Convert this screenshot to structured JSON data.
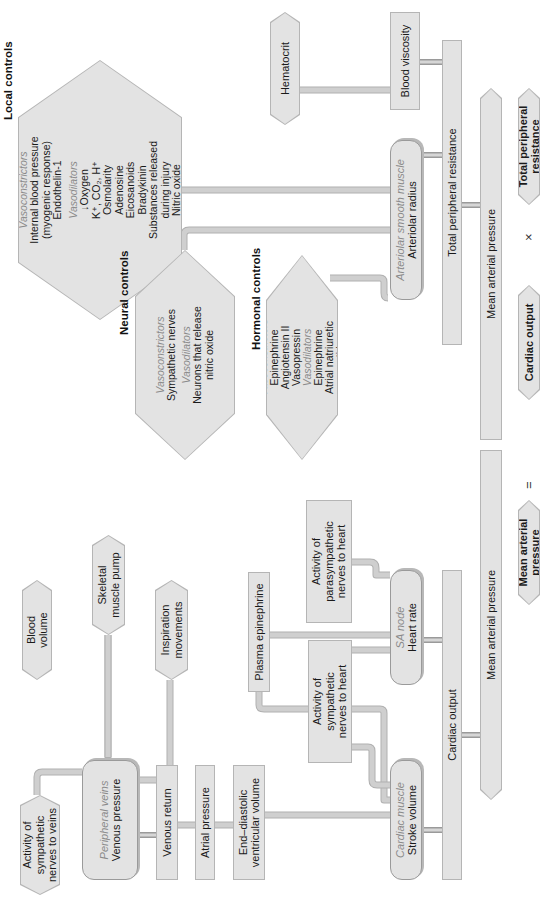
{
  "diagram": {
    "orientation": "rotated 90 degrees counter-clockwise",
    "cardiac_side": {
      "sympathetic_veins": {
        "line1": "Activity of",
        "line2": "sympathetic",
        "line3": "nerves to veins"
      },
      "peripheral_veins": {
        "label": "Peripheral veins",
        "value": "Venous pressure"
      },
      "blood_volume": {
        "line1": "Blood",
        "line2": "volume"
      },
      "skeletal_muscle_pump": {
        "line1": "Skeletal",
        "line2": "muscle pump"
      },
      "inspiration_movements": {
        "line1": "Inspiration",
        "line2": "movements"
      },
      "venous_return": "Venous return",
      "atrial_pressure": "Atrial pressure",
      "edv": {
        "line1": "End–diastolic",
        "line2": "ventricular volume"
      },
      "plasma_epinephrine": "Plasma epinephrine",
      "sympathetic_heart": {
        "line1": "Activity of",
        "line2": "sympathetic",
        "line3": "nerves to heart"
      },
      "parasympathetic_heart": {
        "line1": "Activity of",
        "line2": "parasympathetic",
        "line3": "nerves to heart"
      },
      "cardiac_muscle": {
        "label": "Cardiac muscle",
        "value": "Stroke volume"
      },
      "sa_node": {
        "label": "SA node",
        "value": "Heart rate"
      },
      "cardiac_output_bar": "Cardiac output"
    },
    "mean_arterial_pressure_bar": "Mean arterial pressure",
    "resistance_side": {
      "local_controls": {
        "title": "Local controls",
        "vasoconstrictors_label": "Vasoconstrictors",
        "vasoconstrictors": [
          "Internal blood pressure",
          "(myogenic response)",
          "Endothelin-1"
        ],
        "vasodilators_label": "Vasodilators",
        "vasodilators": [
          "↓Oxygen",
          "K⁺, CO₂, H⁺",
          "Osmolarity",
          "Adenosine",
          "Eicosanoids",
          "Bradykinin",
          "Substances released",
          "during injury",
          "Nitric oxide"
        ]
      },
      "neural_controls": {
        "title": "Neural controls",
        "vasoconstrictors_label": "Vasoconstrictors",
        "vasoconstrictors": [
          "Sympathetic nerves"
        ],
        "vasodilators_label": "Vasodilators",
        "vasodilators": [
          "Neurons that release",
          "nitric oxide"
        ]
      },
      "hormonal_controls": {
        "title": "Hormonal controls",
        "vasoconstrictors_label": "Vasoconstrictors",
        "vasoconstrictors": [
          "Epinephrine",
          "Angiotensin II",
          "Vasopressin"
        ],
        "vasodilators_label": "Vasodilators",
        "vasodilators": [
          "Epinephrine",
          "Atrial natriuretic",
          "peptide"
        ]
      },
      "hematocrit": "Hematocrit",
      "blood_viscosity": "Blood viscosity",
      "arteriolar_smooth_muscle": {
        "label": "Arteriolar smooth muscle",
        "value": "Arteriolar radius"
      },
      "tpr_bar": "Total peripheral resistance"
    },
    "equation": {
      "lhs": "Mean arterial pressure",
      "equals": "=",
      "term1": "Cardiac output",
      "times": "×",
      "term2": "Total peripheral resistance"
    },
    "colors": {
      "box_fill": "#e3e3e3",
      "box_border": "#b5b5b5",
      "connector": "#cfcfcf",
      "italic_label": "#8a8a8a",
      "text": "#1a1a1a"
    }
  }
}
